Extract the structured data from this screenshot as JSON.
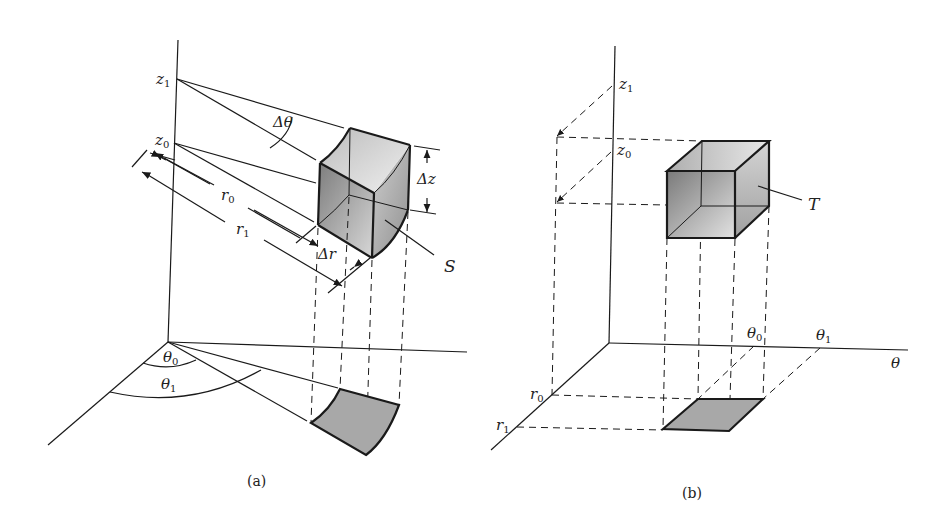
{
  "figure": {
    "panel_a": {
      "caption": "(a)",
      "labels": {
        "z1": "z",
        "z1_sub": "1",
        "z0": "z",
        "z0_sub": "0",
        "dtheta": "Δθ",
        "dz": "Δz",
        "r0": "r",
        "r0_sub": "0",
        "r1": "r",
        "r1_sub": "1",
        "dr": "Δr",
        "S": "S",
        "theta0": "θ",
        "theta0_sub": "0",
        "theta1": "θ",
        "theta1_sub": "1"
      },
      "description": "Cylindrical-coordinate volume element S bounded by r0..r1, θ0..θ1, z0..z1, with its projection onto the base plane"
    },
    "panel_b": {
      "caption": "(b)",
      "labels": {
        "z1": "z",
        "z1_sub": "1",
        "z0": "z",
        "z0_sub": "0",
        "T": "T",
        "theta0": "θ",
        "theta0_sub": "0",
        "theta1": "θ",
        "theta1_sub": "1",
        "theta_axis": "θ",
        "r0": "r",
        "r0_sub": "0",
        "r1": "r",
        "r1_sub": "1"
      },
      "description": "Rectangular box T in (r, θ, z) space corresponding to S, with projection rectangle onto the r-θ plane"
    },
    "colors": {
      "line": "#1a1a1a",
      "shade_light": "#e6e6e6",
      "shade_dark": "#8a8a8a",
      "base_patch": "#a8a8a8"
    }
  }
}
